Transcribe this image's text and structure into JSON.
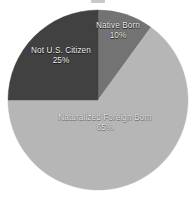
{
  "figure": {
    "background_color": "#ffffff",
    "title_artifact": {
      "name": "cropped-title-remnant",
      "visible_text": ""
    }
  },
  "chart_data": {
    "type": "pie",
    "title": "",
    "subtitle": "",
    "xlabel": "",
    "ylabel": "",
    "grid": false,
    "legend_position": "none",
    "labels_on_slices": true,
    "value_format": "percent",
    "total": 100,
    "start_angle_deg": 0,
    "direction": "clockwise",
    "categories": [
      "Native Born",
      "Naturalized Foreign Born",
      "Not U.S. Citizen"
    ],
    "values": [
      10,
      65,
      25
    ],
    "value_labels": [
      "10%",
      "65%",
      "25%"
    ],
    "colors": [
      "#6e6e6e",
      "#b4b4b4",
      "#3a3a3a"
    ],
    "slices": [
      {
        "label": "Native Born",
        "value": 10,
        "value_label": "10%",
        "color": "#6e6e6e",
        "start_angle_deg": 0,
        "end_angle_deg": 36,
        "label_text_color": "#f2f2f2"
      },
      {
        "label": "Naturalized Foreign Born",
        "value": 65,
        "value_label": "65%",
        "color": "#b4b4b4",
        "start_angle_deg": 36,
        "end_angle_deg": 270,
        "label_text_color": "#e8e8e8"
      },
      {
        "label": "Not U.S. Citizen",
        "value": 25,
        "value_label": "25%",
        "color": "#3a3a3a",
        "start_angle_deg": 270,
        "end_angle_deg": 360,
        "label_text_color": "#f2f2f2"
      }
    ],
    "geometry": {
      "center_x": 98,
      "center_y": 100,
      "radius": 90
    }
  }
}
